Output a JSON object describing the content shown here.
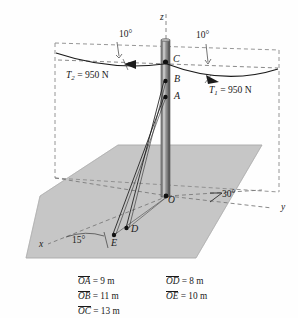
{
  "figure": {
    "colors": {
      "ground_fill": "#c6c6c6",
      "ground_edge": "#9a9a9a",
      "pole_dark": "#6f6f6f",
      "pole_mid": "#8f8f8f",
      "pole_light": "#bdbdbd",
      "line": "#1a1a1a",
      "dashed": "#7a7a7a",
      "background": "#fefefe"
    },
    "axes": [
      {
        "name": "z-axis",
        "label": "z"
      },
      {
        "name": "y-axis",
        "label": "y"
      },
      {
        "name": "x-axis",
        "label": "x"
      }
    ],
    "points": [
      {
        "name": "point-O",
        "label": "O"
      },
      {
        "name": "point-A",
        "label": "A"
      },
      {
        "name": "point-B",
        "label": "B"
      },
      {
        "name": "point-C",
        "label": "C"
      },
      {
        "name": "point-D",
        "label": "D"
      },
      {
        "name": "point-E",
        "label": "E"
      }
    ],
    "forces": [
      {
        "name": "tension-1",
        "symbol": "T",
        "subscript": "1",
        "value": "950",
        "unit": "N",
        "label": "T1 = 950 N"
      },
      {
        "name": "tension-2",
        "symbol": "T",
        "subscript": "2",
        "value": "950",
        "unit": "N",
        "label": "T2 = 950 N"
      }
    ],
    "angles": [
      {
        "name": "angle-left-10",
        "label": "10°"
      },
      {
        "name": "angle-right-10",
        "label": "10°"
      },
      {
        "name": "angle-30",
        "label": "30°",
        "prefix": "∠"
      },
      {
        "name": "angle-15",
        "label": "15°"
      }
    ],
    "measurements": {
      "column_left": [
        {
          "name": "measure-OA",
          "seg": "OA",
          "eq": "=",
          "value": "9 m"
        },
        {
          "name": "measure-OB",
          "seg": "OB",
          "eq": "=",
          "value": "11 m"
        },
        {
          "name": "measure-OC",
          "seg": "OC",
          "eq": "=",
          "value": "13 m"
        }
      ],
      "column_right": [
        {
          "name": "measure-OD",
          "seg": "OD",
          "eq": "=",
          "value": "8 m"
        },
        {
          "name": "measure-OE",
          "seg": "OE",
          "eq": "=",
          "value": "10 m"
        }
      ]
    }
  }
}
